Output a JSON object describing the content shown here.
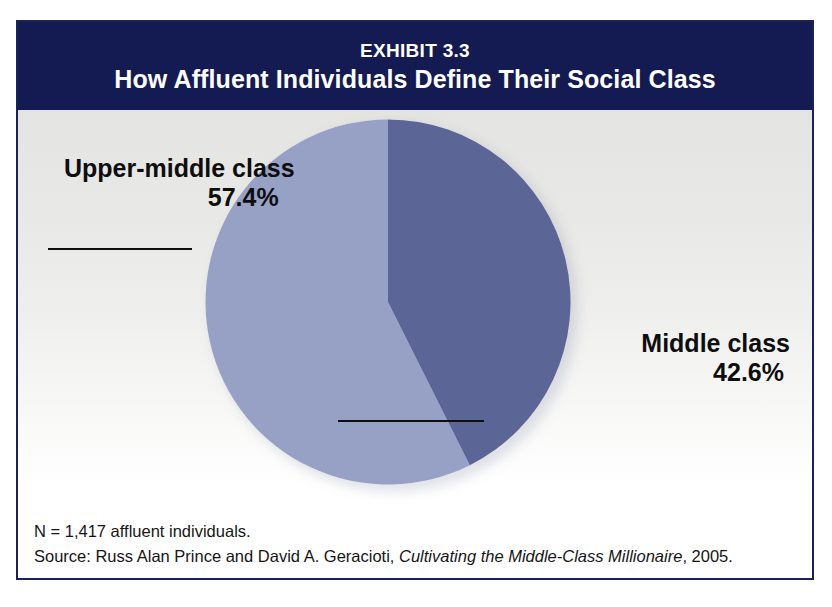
{
  "exhibit": {
    "number": "EXHIBIT 3.3",
    "title": "How Affluent Individuals Define Their Social Class",
    "banner_color": "#141b52",
    "frame_color": "#1b2258"
  },
  "labels": {
    "upper_middle": {
      "name": "Upper-middle class",
      "value": "57.4%"
    },
    "middle": {
      "name": "Middle class",
      "value": "42.6%"
    }
  },
  "footnotes": {
    "sample": "N = 1,417 affluent individuals.",
    "source_prefix": "Source: Russ Alan Prince and David A. Geracioti, ",
    "source_title": "Cultivating the Middle-Class Millionaire",
    "source_suffix": ", 2005."
  },
  "chart_data": {
    "type": "pie",
    "title": "How Affluent Individuals Define Their Social Class",
    "subtitle": "EXHIBIT 3.3",
    "categories": [
      "Upper-middle class",
      "Middle class"
    ],
    "values": [
      57.4,
      42.6
    ],
    "value_labels": [
      "57.4%",
      "42.6%"
    ],
    "unit": "percent",
    "colors": [
      "#97a1c5",
      "#5b6697"
    ],
    "start_angle_deg": 0,
    "direction": "clockwise",
    "legend": "none",
    "data_labels": "external-with-leader-lines",
    "sample_size": 1417,
    "notes": "N = 1,417 affluent individuals.",
    "source": "Russ Alan Prince and David A. Geracioti, Cultivating the Middle-Class Millionaire, 2005."
  }
}
